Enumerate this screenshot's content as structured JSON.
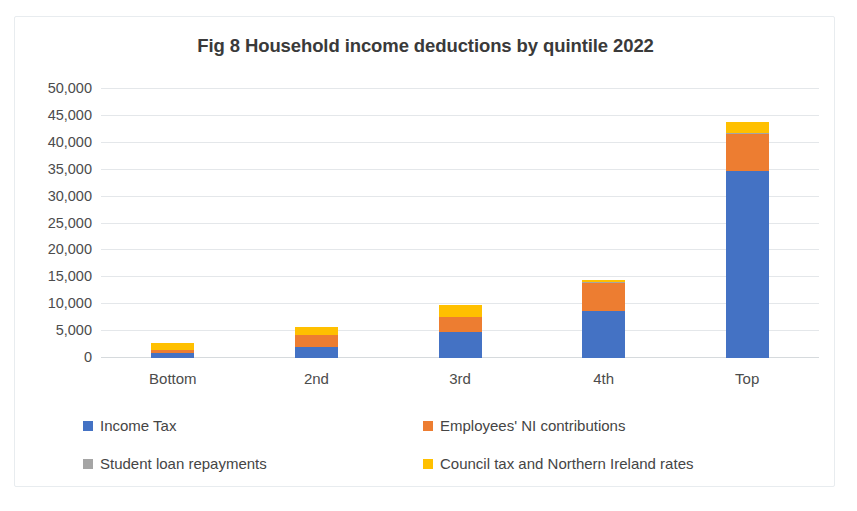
{
  "chart_data": {
    "type": "bar",
    "subtype": "stacked-column",
    "title": "Fig 8 Household income deductions by quintile 2022",
    "xlabel": "",
    "ylabel": "",
    "ylim": [
      0,
      50000
    ],
    "ytick_step": 5000,
    "ytick_labels": [
      "50,000",
      "45,000",
      "40,000",
      "35,000",
      "30,000",
      "25,000",
      "20,000",
      "15,000",
      "10,000",
      "5,000",
      "0"
    ],
    "ytick_values": [
      50000,
      45000,
      40000,
      35000,
      30000,
      25000,
      20000,
      15000,
      10000,
      5000,
      0
    ],
    "grid": true,
    "grid_axis": "y",
    "legend_position": "bottom",
    "categories": [
      "Bottom",
      "2nd",
      "3rd",
      "4th",
      "Top"
    ],
    "series": [
      {
        "name": "Income Tax",
        "color": "#4472C4",
        "values": [
          900,
          2000,
          4800,
          8800,
          34700
        ]
      },
      {
        "name": "Employees' NI contributions",
        "color": "#ED7D31",
        "values": [
          500,
          2300,
          2800,
          5200,
          6900
        ]
      },
      {
        "name": "Student loan repayments",
        "color": "#A5A5A5",
        "values": [
          0,
          0,
          100,
          100,
          200
        ]
      },
      {
        "name": "Council tax and Northern Ireland rates",
        "color": "#FFC000",
        "values": [
          1400,
          1400,
          2100,
          400,
          2100
        ]
      }
    ],
    "totals": [
      2800,
      5700,
      9800,
      14500,
      43900
    ]
  },
  "legend": {
    "items": [
      {
        "label": "Income Tax",
        "color": "#4472C4",
        "marker": "square-swatch-blue"
      },
      {
        "label": "Employees' NI contributions",
        "color": "#ED7D31",
        "marker": "square-swatch-orange"
      },
      {
        "label": "Student loan repayments",
        "color": "#A5A5A5",
        "marker": "square-swatch-gray"
      },
      {
        "label": "Council tax and Northern Ireland rates",
        "color": "#FFC000",
        "marker": "square-swatch-yellow"
      }
    ]
  }
}
